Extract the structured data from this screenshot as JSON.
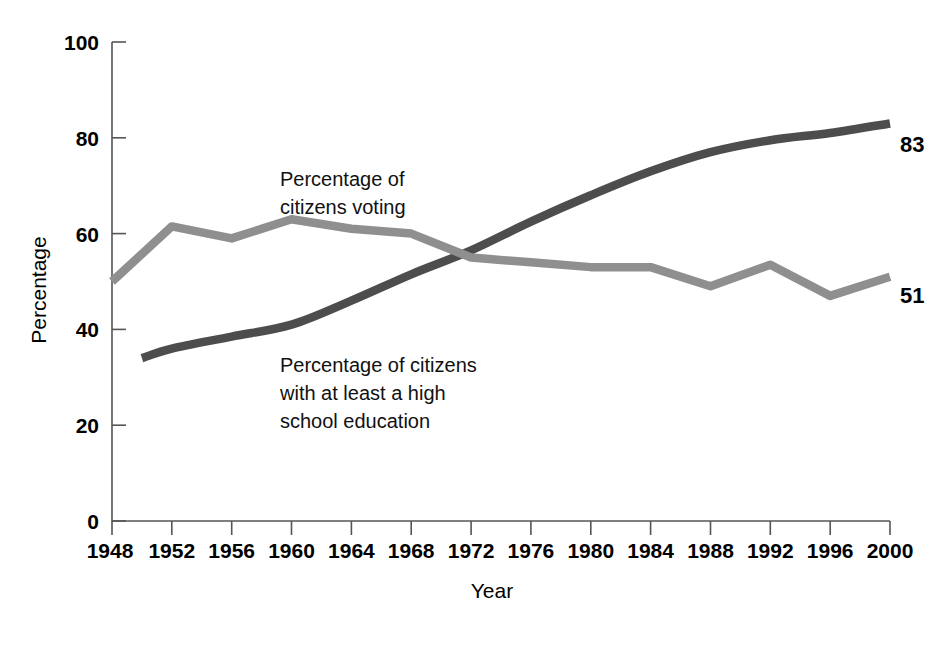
{
  "chart_data": {
    "type": "line",
    "title": "",
    "xlabel": "Year",
    "ylabel": "Percentage",
    "xlim": [
      1948,
      2000
    ],
    "ylim": [
      0,
      100
    ],
    "grid": false,
    "legend_position": "inline-annotations",
    "x": [
      1948,
      1952,
      1956,
      1960,
      1964,
      1968,
      1972,
      1976,
      1980,
      1984,
      1988,
      1992,
      1996,
      2000
    ],
    "xticklabels": [
      "1948",
      "1952",
      "1956",
      "1960",
      "1964",
      "1968",
      "1972",
      "1976",
      "1980",
      "1984",
      "1988",
      "1992",
      "1996",
      "2000"
    ],
    "yticks": [
      0,
      20,
      40,
      60,
      80,
      100
    ],
    "yticklabels": [
      "0",
      "20",
      "40",
      "60",
      "80",
      "100"
    ],
    "series": [
      {
        "name": "Percentage of citizens voting",
        "color": "#8f8f8f",
        "x": [
          1948,
          1952,
          1956,
          1960,
          1964,
          1968,
          1972,
          1976,
          1980,
          1984,
          1988,
          1992,
          1996,
          2000
        ],
        "values": [
          50,
          61.5,
          59,
          63,
          61,
          60,
          55,
          54,
          53,
          53,
          49,
          53.5,
          47,
          51
        ],
        "end_label": "51"
      },
      {
        "name": "Percentage of citizens with at least a high school education",
        "color": "#4d4d4d",
        "x": [
          1950,
          1952,
          1956,
          1960,
          1964,
          1968,
          1972,
          1976,
          1980,
          1984,
          1988,
          1992,
          1996,
          2000
        ],
        "values": [
          34,
          36,
          38.5,
          41,
          46,
          51.5,
          56.5,
          62.5,
          68,
          73,
          77,
          79.5,
          81,
          83
        ],
        "end_label": "83"
      }
    ],
    "annotations": [
      {
        "id": "voting-annotation",
        "lines": [
          "Percentage of",
          "citizens voting"
        ],
        "x": 280,
        "y": 178
      },
      {
        "id": "education-annotation",
        "lines": [
          "Percentage of citizens",
          "with at least a high",
          "school education"
        ],
        "x": 280,
        "y": 364
      }
    ]
  },
  "labels": {
    "y_axis_title": "Percentage",
    "x_axis_title": "Year",
    "ytick_100": "100",
    "ytick_80": "80",
    "ytick_60": "60",
    "ytick_40": "40",
    "ytick_20": "20",
    "ytick_0": "0",
    "xtick_1948": "1948",
    "xtick_1952": "1952",
    "xtick_1956": "1956",
    "xtick_1960": "1960",
    "xtick_1964": "1964",
    "xtick_1968": "1968",
    "xtick_1972": "1972",
    "xtick_1976": "1976",
    "xtick_1980": "1980",
    "xtick_1984": "1984",
    "xtick_1988": "1988",
    "xtick_1992": "1992",
    "xtick_1996": "1996",
    "xtick_2000": "2000",
    "voting_ann_line1": "Percentage of",
    "voting_ann_line2": "citizens voting",
    "edu_ann_line1": "Percentage of citizens",
    "edu_ann_line2": "with at least a high",
    "edu_ann_line3": "school education",
    "voting_end_value": "51",
    "education_end_value": "83"
  }
}
